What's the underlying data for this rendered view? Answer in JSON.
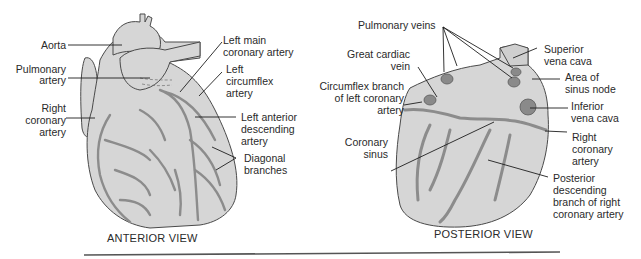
{
  "figure": {
    "anterior": {
      "caption": "ANTERIOR VIEW",
      "labels": {
        "aorta": "Aorta",
        "pulmonary_artery_1": "Pulmonary",
        "pulmonary_artery_2": "artery",
        "right_coronary_1": "Right",
        "right_coronary_2": "coronary",
        "right_coronary_3": "artery",
        "left_main_1": "Left main",
        "left_main_2": "coronary artery",
        "left_circ_1": "Left",
        "left_circ_2": "circumflex",
        "left_circ_3": "artery",
        "lad_1": "Left anterior",
        "lad_2": "descending",
        "lad_3": "artery",
        "diagonal_1": "Diagonal",
        "diagonal_2": "branches"
      }
    },
    "posterior": {
      "caption": "POSTERIOR VIEW",
      "labels": {
        "pulmonary_veins": "Pulmonary veins",
        "great_cardiac_1": "Great cardiac",
        "great_cardiac_2": "vein",
        "circumflex_1": "Circumflex branch",
        "circumflex_2": "of left coronary",
        "circumflex_3": "artery",
        "coronary_sinus_1": "Coronary",
        "coronary_sinus_2": "sinus",
        "svc_1": "Superior",
        "svc_2": "vena cava",
        "sinus_node_1": "Area of",
        "sinus_node_2": "sinus node",
        "ivc_1": "Inferior",
        "ivc_2": "vena cava",
        "rca_1": "Right",
        "rca_2": "coronary",
        "rca_3": "artery",
        "pda_1": "Posterior",
        "pda_2": "descending",
        "pda_3": "branch of right",
        "pda_4": "coronary artery"
      }
    },
    "colors": {
      "heart_fill": "#d6d6d6",
      "vessel": "#8c8c8c",
      "vessel_dark": "#6f6f6f",
      "outline": "#4a4a4a",
      "leader": "#1e1e1e"
    }
  }
}
